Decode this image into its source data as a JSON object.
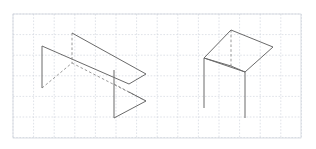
{
  "canvas": {
    "width": 316,
    "height": 149,
    "background_color": "#ffffff",
    "title": "Isometric line drawing of two wireframe objects on graph paper"
  },
  "grid": {
    "name": "graph-paper-grid",
    "origin_x": 13,
    "origin_y": 14,
    "cell_size": 20.6,
    "cols": 14,
    "rows": 6,
    "right_edge": 301,
    "bottom_edge": 138,
    "line_color": "#c9cfd8",
    "line_width": 0.6,
    "dash_pattern": "1.6 1.6",
    "border_color": "#c2c9d3"
  },
  "style": {
    "stroke_color": "#6a6a6a",
    "stroke_color_dark": "#555555",
    "stroke_width": 1.0,
    "hidden_dash_pattern": "2.6 2.2",
    "hidden_stroke_color": "#8d8d8d"
  },
  "figures": [
    {
      "id": "figure-left",
      "label": "Left wireframe: open-sided bench / zig-zag prism",
      "vertices": {
        "A_top_back_left": [
          72,
          33
        ],
        "B_top_right_apex": [
          146,
          74
        ],
        "C_mid_left_top": [
          42,
          46
        ],
        "D_mid_junction": [
          72,
          63
        ],
        "E_mid_right": [
          129,
          84
        ],
        "F_left_leg_bottom": [
          42,
          88
        ],
        "G_bottom_junction": [
          114,
          118
        ],
        "H_bottom_right_apex": [
          146,
          101
        ],
        "I_right_upper": [
          114,
          70
        ]
      },
      "solid_edges": [
        {
          "name": "top-back-edge",
          "from": [
            72,
            33
          ],
          "to": [
            146,
            74
          ]
        },
        {
          "name": "top-front-edge",
          "from": [
            42,
            46
          ],
          "to": [
            129,
            84
          ]
        },
        {
          "name": "right-upper-fold",
          "from": [
            146,
            74
          ],
          "to": [
            129,
            84
          ]
        },
        {
          "name": "left-vertical-leg",
          "from": [
            42,
            46
          ],
          "to": [
            42,
            88
          ]
        },
        {
          "name": "right-vertical-leg",
          "from": [
            114,
            70
          ],
          "to": [
            114,
            118
          ]
        },
        {
          "name": "bottom-front-edge",
          "from": [
            114,
            118
          ],
          "to": [
            146,
            101
          ]
        },
        {
          "name": "bottom-right-fold",
          "from": [
            146,
            101
          ],
          "to": [
            129,
            92
          ]
        }
      ],
      "hidden_edges": [
        {
          "name": "hidden-vertical-center",
          "from": [
            72,
            33
          ],
          "to": [
            72,
            63
          ]
        },
        {
          "name": "hidden-left-diagonal",
          "from": [
            42,
            88
          ],
          "to": [
            72,
            63
          ]
        },
        {
          "name": "hidden-lower-diagonal",
          "from": [
            72,
            63
          ],
          "to": [
            146,
            101
          ]
        },
        {
          "name": "hidden-short-fold",
          "from": [
            129,
            92
          ],
          "to": [
            114,
            84
          ]
        }
      ]
    },
    {
      "id": "figure-right",
      "label": "Right wireframe: three-legged table with quadrilateral top",
      "vertices": {
        "P_top_apex": [
          231,
          30
        ],
        "Q_right": [
          273,
          47
        ],
        "R_front": [
          245,
          72
        ],
        "S_left": [
          204,
          58
        ],
        "T_center_front": [
          231,
          66
        ],
        "leg_left_bottom": [
          204,
          108
        ],
        "leg_front_bottom": [
          245,
          118
        ],
        "leg_center_bottom": [
          231,
          66
        ]
      },
      "solid_edges": [
        {
          "name": "top-edge-back-right",
          "from": [
            231,
            30
          ],
          "to": [
            273,
            47
          ]
        },
        {
          "name": "top-edge-front-right",
          "from": [
            273,
            47
          ],
          "to": [
            245,
            72
          ]
        },
        {
          "name": "top-edge-front-left",
          "from": [
            245,
            72
          ],
          "to": [
            204,
            58
          ]
        },
        {
          "name": "top-edge-back-left",
          "from": [
            204,
            58
          ],
          "to": [
            231,
            30
          ]
        },
        {
          "name": "center-rib",
          "from": [
            231,
            66
          ],
          "to": [
            245,
            72
          ]
        },
        {
          "name": "center-rib-left",
          "from": [
            204,
            58
          ],
          "to": [
            231,
            66
          ]
        },
        {
          "name": "leg-left",
          "from": [
            204,
            58
          ],
          "to": [
            204,
            108
          ]
        },
        {
          "name": "leg-front",
          "from": [
            245,
            72
          ],
          "to": [
            245,
            118
          ]
        }
      ],
      "hidden_edges": [
        {
          "name": "hidden-center-vertical",
          "from": [
            231,
            30
          ],
          "to": [
            231,
            66
          ]
        }
      ]
    }
  ]
}
